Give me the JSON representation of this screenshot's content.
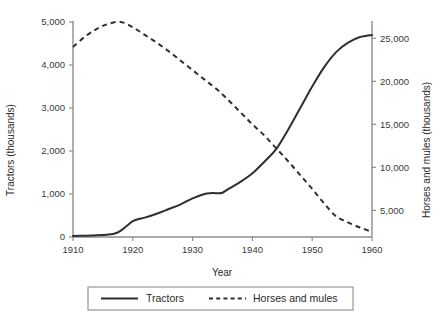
{
  "chart_data": {
    "type": "line",
    "title": "",
    "xlabel": "Year",
    "ylabel": "Tractors (thousands)",
    "y2label": "Horses and mules (thousands)",
    "xlim": [
      1910,
      1960
    ],
    "ylim": [
      0,
      5000
    ],
    "y2lim": [
      1900,
      26900
    ],
    "grid": false,
    "legend_position": "bottom-center",
    "xticks": [
      1910,
      1920,
      1930,
      1940,
      1950,
      1960
    ],
    "xtick_labels": [
      "1910",
      "1920",
      "1930",
      "1940",
      "1950",
      "1960"
    ],
    "yticks": [
      0,
      1000,
      2000,
      3000,
      4000,
      5000
    ],
    "ytick_labels": [
      "0",
      "1,000",
      "2,000",
      "3,000",
      "4,000",
      "5,000"
    ],
    "y2ticks": [
      5000,
      10000,
      15000,
      20000,
      25000
    ],
    "y2tick_labels": [
      "5,000",
      "10,000",
      "15,000",
      "20,000",
      "25,000"
    ],
    "series": [
      {
        "name": "Tractors",
        "style": "solid",
        "axis": "left",
        "color": "#2f2f2f",
        "x": [
          1910,
          1912,
          1914,
          1916,
          1917,
          1918,
          1919,
          1920,
          1921,
          1922,
          1924,
          1926,
          1928,
          1930,
          1932,
          1933,
          1934,
          1935,
          1936,
          1938,
          1940,
          1942,
          1944,
          1946,
          1948,
          1950,
          1952,
          1954,
          1956,
          1958,
          1960
        ],
        "y": [
          25,
          30,
          40,
          60,
          80,
          150,
          260,
          370,
          420,
          450,
          540,
          650,
          760,
          900,
          1000,
          1020,
          1020,
          1030,
          1120,
          1280,
          1480,
          1750,
          2050,
          2500,
          3000,
          3500,
          3950,
          4300,
          4520,
          4650,
          4700
        ]
      },
      {
        "name": "Horses and mules",
        "style": "dashed",
        "axis": "right",
        "color": "#2f2f2f",
        "x": [
          1910,
          1912,
          1914,
          1916,
          1918,
          1920,
          1922,
          1924,
          1926,
          1928,
          1930,
          1932,
          1934,
          1936,
          1938,
          1940,
          1942,
          1944,
          1946,
          1948,
          1950,
          1952,
          1954,
          1956,
          1958,
          1960
        ],
        "y": [
          24000,
          25200,
          26100,
          26700,
          26900,
          26300,
          25400,
          24500,
          23500,
          22400,
          21300,
          20200,
          19100,
          17800,
          16400,
          15000,
          13700,
          12200,
          10700,
          9100,
          7500,
          5800,
          4300,
          3600,
          3000,
          2500
        ]
      }
    ],
    "legend": [
      {
        "label": "Tractors",
        "style": "solid"
      },
      {
        "label": "Horses and mules",
        "style": "dashed"
      }
    ]
  }
}
